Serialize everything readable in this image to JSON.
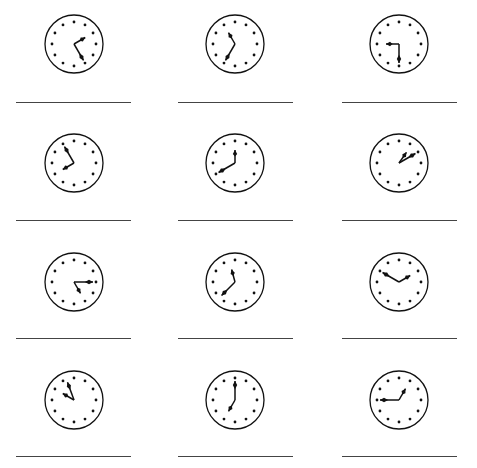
{
  "worksheet": {
    "task": "Write the time shown on each clock",
    "colors": {
      "ink": "#111111",
      "line": "#444444",
      "background": "#ffffff"
    },
    "clocks": [
      {
        "index": 1,
        "hour_deg": 60,
        "minute_deg": 150,
        "answer": ""
      },
      {
        "index": 2,
        "hour_deg": 330,
        "minute_deg": 210,
        "answer": ""
      },
      {
        "index": 3,
        "hour_deg": 270,
        "minute_deg": 180,
        "answer": ""
      },
      {
        "index": 4,
        "hour_deg": 240,
        "minute_deg": 330,
        "answer": ""
      },
      {
        "index": 5,
        "hour_deg": 0,
        "minute_deg": 240,
        "answer": ""
      },
      {
        "index": 6,
        "hour_deg": 35,
        "minute_deg": 60,
        "answer": ""
      },
      {
        "index": 7,
        "hour_deg": 150,
        "minute_deg": 90,
        "answer": ""
      },
      {
        "index": 8,
        "hour_deg": 345,
        "minute_deg": 225,
        "answer": ""
      },
      {
        "index": 9,
        "hour_deg": 60,
        "minute_deg": 300,
        "answer": ""
      },
      {
        "index": 10,
        "hour_deg": 300,
        "minute_deg": 340,
        "answer": ""
      },
      {
        "index": 11,
        "hour_deg": 210,
        "minute_deg": 0,
        "answer": ""
      },
      {
        "index": 12,
        "hour_deg": 30,
        "minute_deg": 270,
        "answer": ""
      }
    ]
  }
}
